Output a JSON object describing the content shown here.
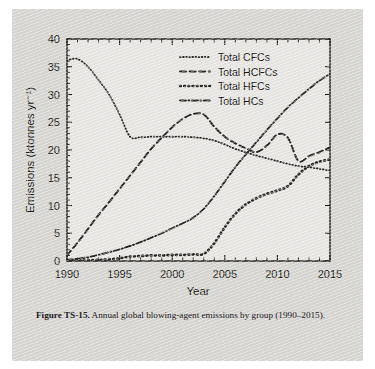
{
  "figure": {
    "label": "Figure TS-15.",
    "caption_text": " Annual global blowing-agent emissions by group (1990–2015).",
    "background_color": "#d9d8d4",
    "ink_color": "#2a2724"
  },
  "chart_data": {
    "type": "line",
    "title": "",
    "xlabel": "Year",
    "ylabel": "Emissions (ktonnes yr⁻¹)",
    "xlim": [
      1990,
      2015
    ],
    "ylim": [
      0,
      40
    ],
    "xticks": [
      1990,
      1995,
      2000,
      2005,
      2010,
      2015
    ],
    "xtick_labels": [
      "1990",
      "1995",
      "2000",
      "2005",
      "2010",
      "2015"
    ],
    "x_minor_tick_interval": 1,
    "yticks": [
      0,
      5,
      10,
      15,
      20,
      25,
      30,
      35,
      40
    ],
    "ytick_labels": [
      "0",
      "5",
      "10",
      "15",
      "20",
      "25",
      "30",
      "35",
      "40"
    ],
    "grid": false,
    "legend_position": "upper-center",
    "x": [
      1990,
      1991,
      1992,
      1993,
      1994,
      1995,
      1996,
      1997,
      1998,
      1999,
      2000,
      2001,
      2002,
      2003,
      2004,
      2005,
      2006,
      2007,
      2008,
      2009,
      2010,
      2011,
      2012,
      2013,
      2014,
      2015
    ],
    "series": [
      {
        "name": "Total CFCs",
        "dash_style": "fine-dotted",
        "values": [
          36.2,
          36.4,
          35.0,
          32.6,
          30.0,
          26.4,
          22.4,
          22.3,
          22.4,
          22.4,
          22.4,
          22.4,
          22.3,
          22.1,
          21.7,
          21.0,
          20.2,
          19.6,
          19.0,
          18.5,
          18.0,
          17.5,
          17.1,
          16.9,
          16.6,
          16.3
        ]
      },
      {
        "name": "Total HCFCs",
        "dash_style": "long-dashed",
        "values": [
          1.0,
          3.3,
          5.8,
          8.3,
          10.6,
          13.0,
          15.4,
          17.8,
          20.2,
          22.2,
          24.1,
          25.6,
          26.5,
          26.4,
          24.2,
          22.4,
          21.2,
          20.3,
          19.6,
          20.8,
          22.8,
          22.2,
          18.0,
          18.9,
          19.6,
          20.5
        ]
      },
      {
        "name": "Total HFCs",
        "dash_style": "thick-dotted",
        "values": [
          0.0,
          0.05,
          0.1,
          0.2,
          0.3,
          0.5,
          0.8,
          0.9,
          1.0,
          1.0,
          1.1,
          1.1,
          1.2,
          1.3,
          3.2,
          6.1,
          8.5,
          10.2,
          11.3,
          12.1,
          12.7,
          13.5,
          15.6,
          17.1,
          17.9,
          18.3
        ]
      },
      {
        "name": "Total HCs",
        "dash_style": "dash-dot",
        "values": [
          0.2,
          0.4,
          0.7,
          1.1,
          1.6,
          2.1,
          2.7,
          3.4,
          4.2,
          5.0,
          5.9,
          6.8,
          7.8,
          9.4,
          11.7,
          14.3,
          16.9,
          19.2,
          21.4,
          23.6,
          25.7,
          27.7,
          29.4,
          31.0,
          32.5,
          33.7
        ]
      }
    ]
  },
  "legend": {
    "entries": [
      {
        "label": "Total CFCs"
      },
      {
        "label": "Total HCFCs"
      },
      {
        "label": "Total HFCs"
      },
      {
        "label": "Total HCs"
      }
    ]
  }
}
